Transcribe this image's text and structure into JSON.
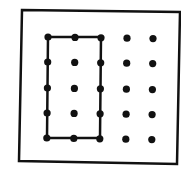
{
  "diagram": {
    "type": "geoboard",
    "grid": {
      "rows": 5,
      "cols": 5
    },
    "colors": {
      "ink": "#111111",
      "background": "#ffffff"
    },
    "frame": {
      "points": "22,10 180,12 177,164 19,161"
    },
    "col_x": [
      48,
      75,
      101,
      127,
      153
    ],
    "row_y": [
      37,
      62,
      88,
      113,
      138
    ],
    "shape": {
      "name": "rectangle",
      "corners_grid": [
        [
          0,
          0
        ],
        [
          0,
          2
        ],
        [
          4,
          2
        ],
        [
          4,
          0
        ]
      ],
      "points": "48,37 101,37 100,138 47,138"
    }
  }
}
